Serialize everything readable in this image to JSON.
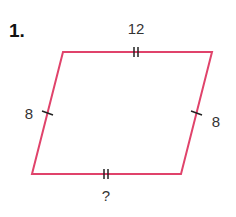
{
  "problem": {
    "number": "1.",
    "shape": "parallelogram",
    "stroke_color": "#e0436b",
    "tick_color": "#222222",
    "vertices": {
      "top_left": [
        63,
        52
      ],
      "top_right": [
        212,
        52
      ],
      "bottom_right": [
        181,
        174
      ],
      "bottom_left": [
        32,
        174
      ]
    },
    "sides": {
      "top": {
        "label": "12",
        "tick_marks": 2
      },
      "bottom": {
        "label": "?",
        "tick_marks": 2
      },
      "left": {
        "label": "8",
        "tick_marks": 1
      },
      "right": {
        "label": "8",
        "tick_marks": 1
      }
    }
  }
}
